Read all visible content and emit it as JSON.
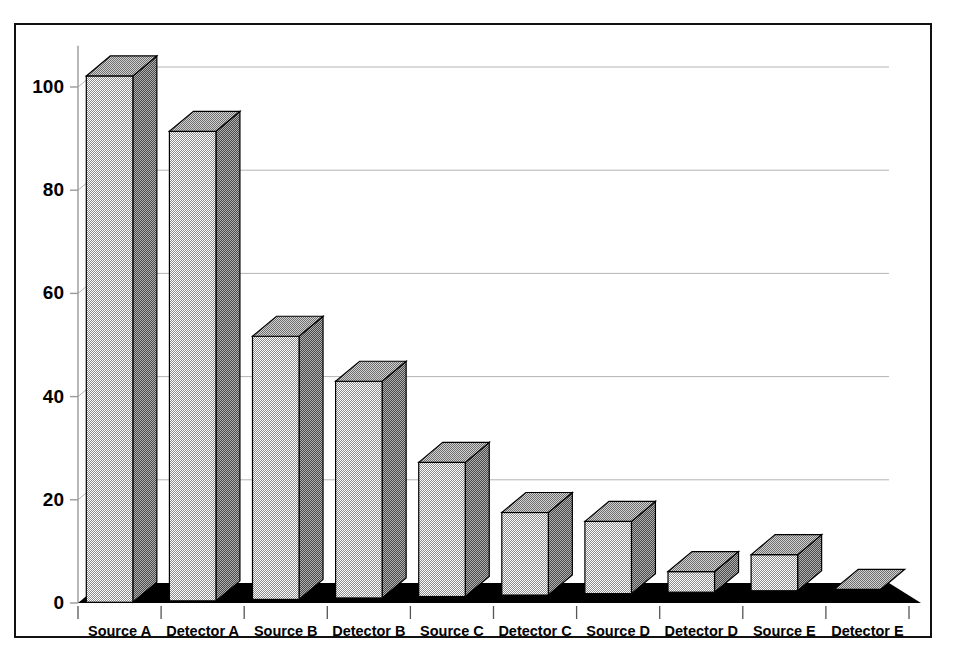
{
  "chart_data": {
    "type": "bar",
    "title": "",
    "subtitle": "",
    "xlabel": "",
    "ylabel": "",
    "categories": [
      "Source A",
      "Detector A",
      "Source B",
      "Detector B",
      "Source C",
      "Detector C",
      "Source D",
      "Detector D",
      "Source E",
      "Detector E"
    ],
    "values": [
      102,
      91,
      51,
      42,
      26,
      16,
      14,
      4,
      7,
      0
    ],
    "series": [
      {
        "name": "",
        "values": [
          102,
          91,
          51,
          42,
          26,
          16,
          14,
          4,
          7,
          0
        ]
      }
    ],
    "ylim": [
      0,
      108
    ],
    "yticks": [
      0,
      20,
      40,
      60,
      80,
      100
    ],
    "ytick_labels": [
      "0",
      "20",
      "40",
      "60",
      "80",
      "100"
    ],
    "grid": true,
    "grid_axis": "y",
    "legend": false,
    "legend_position": "none",
    "style": "3d-perspective",
    "bar_front_color": "#c8c8c8",
    "bar_side_color": "#707070",
    "bar_top_color": "#a8a8a8",
    "bar_edge_color": "#000000",
    "floor_color": "#000000",
    "grid_color": "#b4b4b4",
    "axis_color": "#9a9a9a",
    "background_color": "#ffffff",
    "frame_color": "#111111",
    "text_color": "#000000"
  }
}
